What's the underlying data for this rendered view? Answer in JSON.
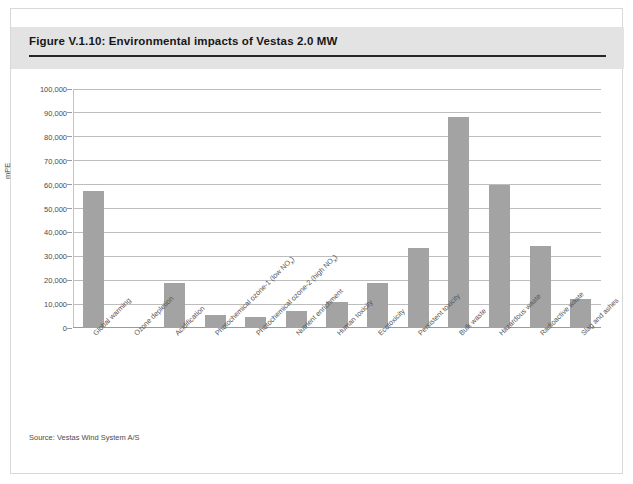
{
  "figure": {
    "title": "Figure V.1.10: Environmental impacts of Vestas 2.0 MW",
    "source": "Source: Vestas Wind System A/S"
  },
  "chart_data": {
    "type": "bar",
    "title": "Environmental impacts of Vestas 2.0 MW",
    "xlabel": "",
    "ylabel": "mPE",
    "ylim": [
      0,
      100000
    ],
    "ytick_values": [
      0,
      10000,
      20000,
      30000,
      40000,
      50000,
      60000,
      70000,
      80000,
      90000,
      100000
    ],
    "ytick_labels": [
      "0",
      "10,000",
      "20,000",
      "30,000",
      "40,000",
      "50,000",
      "60,000",
      "70,000",
      "80,000",
      "90,000",
      "100,000"
    ],
    "grid": true,
    "legend": "none",
    "bar_color": "#a3a3a3",
    "categories": [
      "Global warming",
      "Ozone depletion",
      "Acidification",
      "Photochemical ozone-1 (low NOx)",
      "Photochemical ozone-2 (high NOx)",
      "Nutrient enrichment",
      "Human toxicity",
      "Ecotoxicity",
      "Persistent toxicity",
      "Bulk waste",
      "Hazardous waste",
      "Radioactive waste",
      "Slag and ashes"
    ],
    "category_labels_html": [
      "Global warming",
      "Ozone depletion",
      "Acidification",
      "Photochemical ozone-1 (low NO<sub>x</sub>)",
      "Photochemical ozone-2 (high NO<sub>x</sub>)",
      "Nutrient enrichment",
      "Human toxicity",
      "Ecotoxicity",
      "Persistent toxicity",
      "Bulk waste",
      "Hazardous waste",
      "Radioactive waste",
      "Slag and ashes"
    ],
    "values": [
      57500,
      0,
      19000,
      5500,
      4800,
      7000,
      11000,
      19000,
      33500,
      88500,
      60000,
      34500,
      12000
    ]
  }
}
